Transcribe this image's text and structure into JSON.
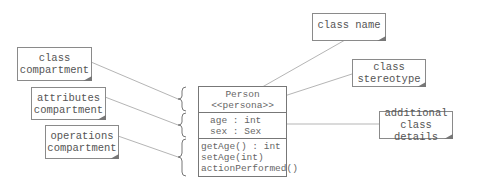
{
  "diagram": {
    "type": "UML class diagram anatomy",
    "class_box": {
      "name": "Person",
      "stereotype": "<<persona>>",
      "attributes": [
        "age : int",
        "sex : Sex"
      ],
      "operations": [
        "getAge() : int",
        "setAge(int)",
        "actionPerformed()"
      ]
    },
    "notes": {
      "class_compartment": [
        "class",
        "compartment"
      ],
      "attributes_compartment": [
        "attributes",
        "compartment"
      ],
      "operations_compartment": [
        "operations",
        "compartment"
      ],
      "class_name": [
        "class name"
      ],
      "class_stereotype": [
        "class",
        "stereotype"
      ],
      "additional_class_details": [
        "additional",
        "class details"
      ]
    },
    "colors": {
      "line": "#b5b5b5",
      "border": "#8a8a8a",
      "text": "#555555",
      "background": "#ffffff"
    }
  }
}
